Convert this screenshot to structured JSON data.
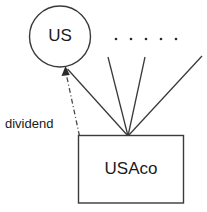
{
  "diagram": {
    "title": "",
    "nodes": [
      {
        "id": "us",
        "label": "US",
        "shape": "circle",
        "cx": 60,
        "cy": 36.5,
        "r": 30.5
      },
      {
        "id": "usaco",
        "label": "USAco",
        "shape": "rectangle",
        "x": 78.5,
        "y": 135.5,
        "width": 105,
        "height": 67.5,
        "text_x": 131,
        "text_y": 170
      }
    ],
    "edges": [
      {
        "id": "dividend-edge",
        "label": "dividend",
        "style": "dash-dot",
        "arrow": "end",
        "from": "usaco",
        "to": "us",
        "x1": 79.5,
        "y1": 136,
        "x2": 65.5,
        "y2": 70,
        "label_x": 5,
        "label_y": 125
      },
      {
        "id": "ownership-edge-1",
        "label": "",
        "style": "solid",
        "arrow": "none",
        "from": "us",
        "to": "usaco",
        "x1": 67.5,
        "y1": 69,
        "x2": 128,
        "y2": 136
      },
      {
        "id": "ownership-edge-2",
        "label": "",
        "style": "solid",
        "arrow": "none",
        "from": "other-1",
        "to": "usaco",
        "x1": 108,
        "y1": 57,
        "x2": 128,
        "y2": 136
      },
      {
        "id": "ownership-edge-3",
        "label": "",
        "style": "solid",
        "arrow": "none",
        "from": "other-2",
        "to": "usaco",
        "x1": 145,
        "y1": 57,
        "x2": 128,
        "y2": 136
      },
      {
        "id": "ownership-edge-4",
        "label": "",
        "style": "solid",
        "arrow": "none",
        "from": "other-3",
        "to": "usaco",
        "x1": 202,
        "y1": 56,
        "x2": 128,
        "y2": 136
      }
    ],
    "ellipsis_dots": {
      "label": ". . . . .",
      "count": 5,
      "y": 39,
      "radius": 1.3,
      "x_positions": [
        116,
        131,
        146,
        161,
        176
      ]
    },
    "colors": {
      "stroke": "#3a3a3a",
      "text": "#1a1a1a",
      "background": "#ffffff",
      "dash_stroke": "#4a4a4a"
    }
  }
}
